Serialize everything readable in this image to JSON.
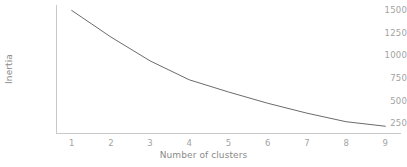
{
  "chart_data": {
    "type": "line",
    "title": "",
    "xlabel": "Number of clusters",
    "ylabel": "Inertia",
    "x": [
      1,
      2,
      3,
      4,
      5,
      6,
      7,
      8,
      9
    ],
    "values": [
      1500,
      1205,
      940,
      730,
      595,
      470,
      360,
      265,
      215
    ],
    "series": [
      {
        "name": "inertia",
        "values": [
          1500,
          1205,
          940,
          730,
          595,
          470,
          360,
          265,
          215
        ],
        "color": "#6b6b6b"
      }
    ],
    "xticks": [
      "1",
      "2",
      "3",
      "4",
      "5",
      "6",
      "7",
      "8",
      "9"
    ],
    "yticks": [
      "250",
      "500",
      "750",
      "1000",
      "1250",
      "1500"
    ],
    "ytick_values": [
      250,
      500,
      750,
      1000,
      1250,
      1500
    ],
    "xlim": [
      0.6,
      9.4
    ],
    "ylim": [
      140,
      1560
    ],
    "grid": false,
    "legend": "none",
    "line_color": "#6b6b6b",
    "axis_color": "#c9c9c9",
    "tick_label_color": "#a3a3a3",
    "axis_title_color": "#8a8a8a",
    "background_color": "#ffffff"
  }
}
